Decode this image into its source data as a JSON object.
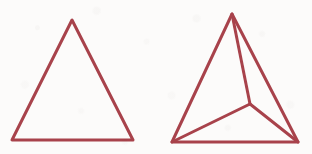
{
  "canvas": {
    "width": 312,
    "height": 154,
    "background_color": "#fcfbfa",
    "medium": "scanned line drawing"
  },
  "style": {
    "stroke_color": "#a8434b",
    "stroke_width": 3,
    "line_cap": "round",
    "line_join": "round",
    "fill": "none"
  },
  "figures": [
    {
      "id": "figure-left",
      "name": "plain-triangle",
      "description": "Equilateral-like triangle outline with no internal subdivision",
      "vertices": {
        "apex": {
          "x": 72,
          "y": 20
        },
        "bottom_left": {
          "x": 12,
          "y": 140
        },
        "bottom_right": {
          "x": 133,
          "y": 140
        }
      },
      "edges": [
        {
          "name": "left-edge",
          "from": "apex",
          "to": "bottom_left"
        },
        {
          "name": "right-edge",
          "from": "apex",
          "to": "bottom_right"
        },
        {
          "name": "bottom-edge",
          "from": "bottom_left",
          "to": "bottom_right"
        }
      ],
      "interior_point": null,
      "region_count": 1
    },
    {
      "id": "figure-right",
      "name": "triangle-with-interior-point",
      "description": "Triangle outline subdivided into three regions by cevians from an interior point to each vertex",
      "vertices": {
        "apex": {
          "x": 232,
          "y": 14
        },
        "bottom_left": {
          "x": 172,
          "y": 142
        },
        "bottom_right": {
          "x": 298,
          "y": 142
        }
      },
      "edges": [
        {
          "name": "left-edge",
          "from": "apex",
          "to": "bottom_left"
        },
        {
          "name": "right-edge",
          "from": "apex",
          "to": "bottom_right"
        },
        {
          "name": "bottom-edge",
          "from": "bottom_left",
          "to": "bottom_right"
        }
      ],
      "interior_point": {
        "name": "center-point",
        "x": 250,
        "y": 104
      },
      "interior_edges": [
        {
          "name": "cevian-to-apex",
          "from": "center-point",
          "to": "apex"
        },
        {
          "name": "cevian-to-bottom-left",
          "from": "center-point",
          "to": "bottom_left"
        },
        {
          "name": "cevian-to-bottom-right",
          "from": "center-point",
          "to": "bottom_right"
        }
      ],
      "region_count": 3
    }
  ]
}
